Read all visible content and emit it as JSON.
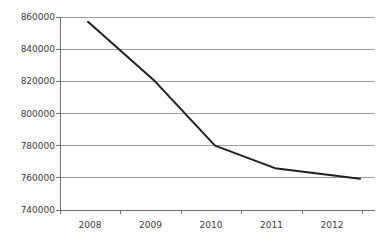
{
  "chart_data": {
    "type": "line",
    "title": "",
    "subtitle": "",
    "xlabel": "",
    "ylabel": "",
    "categories": [
      "2008",
      "2009",
      "2010",
      "2011",
      "2012"
    ],
    "x": [
      2008,
      2009,
      2010,
      2011,
      2012
    ],
    "values": [
      857000,
      820000,
      780000,
      766000,
      759500
    ],
    "series": [
      {
        "name": "",
        "values": [
          857000,
          820000,
          780000,
          766000,
          759500
        ]
      }
    ],
    "ylim": [
      740000,
      860000
    ],
    "ytick_values": [
      740000,
      760000,
      780000,
      800000,
      820000,
      840000,
      860000
    ],
    "ytick_labels": [
      "740000",
      "760000",
      "780000",
      "800000",
      "820000",
      "840000",
      "860000"
    ],
    "xtick_labels": [
      "2008",
      "2009",
      "2010",
      "2011",
      "2012"
    ],
    "grid": true,
    "grid_axis": "y",
    "legend": false,
    "legend_position": "none",
    "markers": false,
    "annotations": []
  },
  "style": {
    "background_color": "#ffffff",
    "line_color": "#231f20",
    "grid_color": "#9a9a9a",
    "axis_color": "#6e6e6e",
    "text_color": "#3a3a3a",
    "line_width": 2
  },
  "geometry": {
    "plot_left": 60,
    "plot_right": 375,
    "plot_top": 17,
    "plot_bottom": 210,
    "x_tick_positions": [
      60,
      120,
      181,
      241,
      302,
      362
    ],
    "point_x_positions": [
      88,
      155,
      215,
      275,
      360
    ]
  }
}
